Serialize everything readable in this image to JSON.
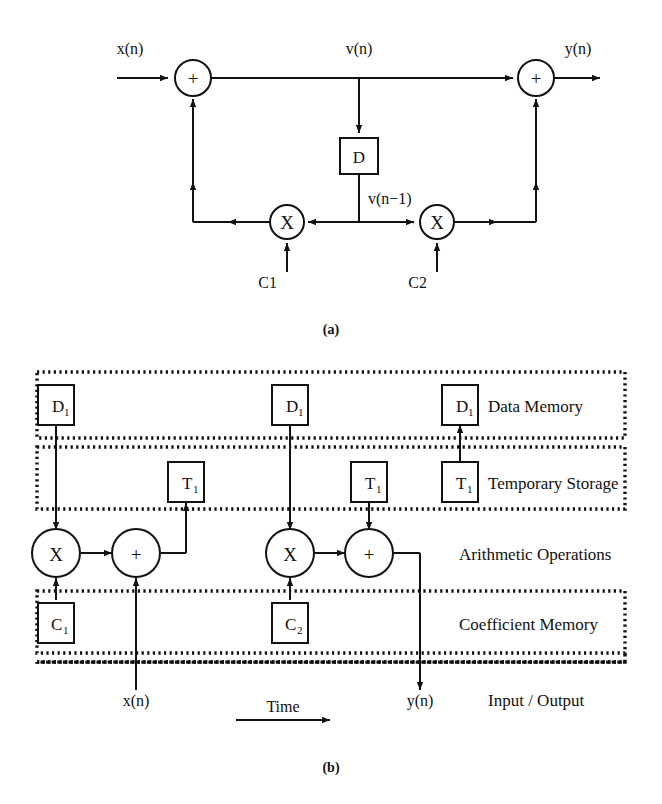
{
  "figure": {
    "caption_a": "(a)",
    "caption_b": "(b)"
  },
  "diagram_a": {
    "name": "first-order-iir-filter-signal-flow-graph",
    "signals": {
      "input": "x(n)",
      "node_v": "v(n)",
      "delayed_v": "v(n−1)",
      "output": "y(n)"
    },
    "blocks": {
      "delay": "D"
    },
    "operators": {
      "adder_left": "+",
      "adder_right": "+",
      "mult_left": "X",
      "mult_right": "X"
    },
    "coefficients": {
      "c1": "C1",
      "c2": "C2"
    }
  },
  "diagram_b": {
    "name": "resource-time-scheduling-diagram",
    "regions": [
      {
        "id": "data-memory",
        "label": "Data Memory"
      },
      {
        "id": "temporary-storage",
        "label": "Temporary Storage"
      },
      {
        "id": "arithmetic-operations",
        "label": "Arithmetic Operations"
      },
      {
        "id": "coefficient-memory",
        "label": "Coefficient Memory"
      },
      {
        "id": "input-output",
        "label": "Input / Output"
      }
    ],
    "data_memory_cells": [
      {
        "base": "D",
        "sub": "1"
      },
      {
        "base": "D",
        "sub": "1"
      },
      {
        "base": "D",
        "sub": "1"
      }
    ],
    "temporary_storage_cells": [
      {
        "base": "T",
        "sub": "1"
      },
      {
        "base": "T",
        "sub": "1"
      },
      {
        "base": "T",
        "sub": "1"
      }
    ],
    "arithmetic_units": [
      {
        "op": "X"
      },
      {
        "op": "+"
      },
      {
        "op": "X"
      },
      {
        "op": "+"
      }
    ],
    "coefficient_cells": [
      {
        "base": "C",
        "sub": "1"
      },
      {
        "base": "C",
        "sub": "2"
      }
    ],
    "io_signals": {
      "input": "x(n)",
      "output": "y(n)"
    },
    "time_axis_label": "Time"
  },
  "style": {
    "stroke": "#111111",
    "background": "#ffffff",
    "dotted_border": "#111111"
  }
}
